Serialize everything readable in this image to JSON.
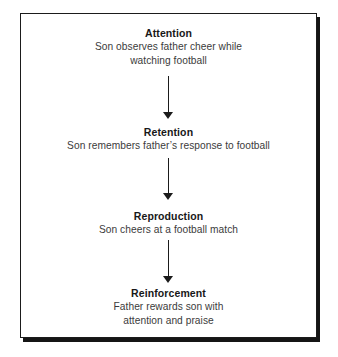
{
  "diagram": {
    "type": "flowchart",
    "orientation": "vertical",
    "frame_color": "#1b1b1b",
    "background_color": "#ffffff",
    "title_color": "#181818",
    "body_color": "#3b3b3b",
    "arrow_color": "#1b1b1b",
    "steps": [
      {
        "title": "Attention",
        "lines": [
          "Son observes father cheer while",
          "watching football"
        ]
      },
      {
        "title": "Retention",
        "lines": [
          "Son remembers father’s response to football"
        ]
      },
      {
        "title": "Reproduction",
        "lines": [
          "Son cheers at a football match"
        ]
      },
      {
        "title": "Reinforcement",
        "lines": [
          "Father rewards son with",
          "attention and praise"
        ]
      }
    ],
    "connectors": [
      {
        "from": "Attention",
        "to": "Retention",
        "glyph": "down-arrow"
      },
      {
        "from": "Retention",
        "to": "Reproduction",
        "glyph": "down-arrow"
      },
      {
        "from": "Reproduction",
        "to": "Reinforcement",
        "glyph": "down-arrow"
      }
    ]
  }
}
